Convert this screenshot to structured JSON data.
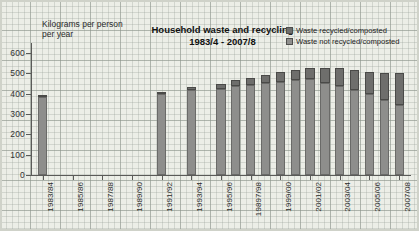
{
  "title": {
    "line1": "Household waste and recycling",
    "line2": "1983/4 - 2007/8"
  },
  "axis_note": {
    "line1": "Kilograms per person",
    "line2": "per year"
  },
  "legend": {
    "recycled_label": "Waste recycled/composted",
    "not_recycled_label": "Waste not recycled/composted",
    "recycled_color": "#6e6e6c",
    "not_recycled_color": "#8e8e8c"
  },
  "chart_data": {
    "type": "bar",
    "stacked": true,
    "title": "Household waste and recycling 1983/4 - 2007/8",
    "xlabel": "",
    "ylabel": "Kilograms per person per year",
    "ylim": [
      0,
      650
    ],
    "yticks": [
      0,
      100,
      200,
      300,
      400,
      500,
      600
    ],
    "ytick_labels": [
      "0",
      "100",
      "200",
      "300",
      "400",
      "500",
      "600"
    ],
    "grid": true,
    "legend_position": "top-right",
    "xtick_labels": [
      "1983/84",
      "1985/86",
      "1987/88",
      "1989/90",
      "1991/92",
      "1993/94",
      "1995/96",
      "19897/98",
      "1999/00",
      "2001/02",
      "2003/04",
      "2005/06",
      "2007/08"
    ],
    "categories": [
      "1983/84",
      "1984/85",
      "1985/86",
      "1986/87",
      "1987/88",
      "1988/89",
      "1989/90",
      "1990/91",
      "1991/92",
      "1992/93",
      "1993/94",
      "1994/95",
      "1995/96",
      "1996/97",
      "1997/98",
      "1998/99",
      "1999/00",
      "2000/01",
      "2001/02",
      "2002/03",
      "2003/04",
      "2004/05",
      "2005/06",
      "2006/07",
      "2007/08"
    ],
    "series": [
      {
        "name": "Waste not recycled/composted",
        "values": [
          383,
          null,
          null,
          null,
          null,
          null,
          null,
          null,
          398,
          null,
          418,
          null,
          425,
          440,
          445,
          455,
          460,
          468,
          472,
          455,
          440,
          420,
          400,
          370,
          345
        ]
      },
      {
        "name": "Waste recycled/composted",
        "values": [
          5,
          null,
          null,
          null,
          null,
          null,
          null,
          null,
          12,
          null,
          15,
          null,
          25,
          30,
          35,
          40,
          45,
          50,
          55,
          70,
          85,
          95,
          105,
          130,
          155
        ]
      }
    ],
    "totals": [
      388,
      null,
      null,
      null,
      null,
      null,
      null,
      null,
      410,
      null,
      433,
      null,
      450,
      470,
      480,
      495,
      505,
      518,
      527,
      525,
      525,
      515,
      505,
      500,
      500
    ]
  }
}
